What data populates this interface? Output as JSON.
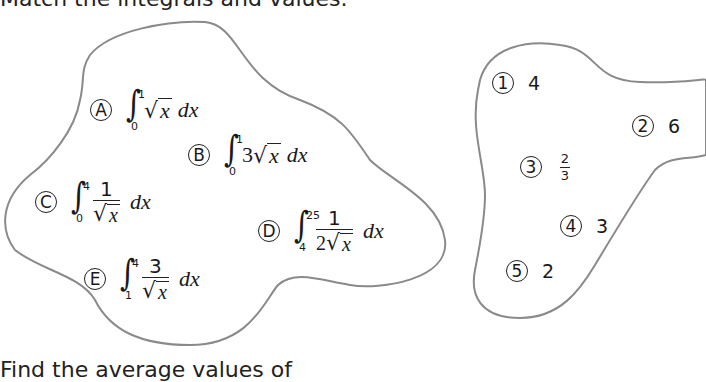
{
  "title": "Match the integrals and values.",
  "footer": "Find the average values of",
  "outline_color": "#8a8a8a",
  "integrals": [
    {
      "label": "A",
      "lower": "0",
      "upper": "1",
      "coef": "",
      "kind": "sqrt",
      "radicand": "x",
      "dx": "dx"
    },
    {
      "label": "B",
      "lower": "0",
      "upper": "1",
      "coef": "3",
      "kind": "sqrt",
      "radicand": "x",
      "dx": "dx"
    },
    {
      "label": "C",
      "lower": "0",
      "upper": "4",
      "numerator": "1",
      "den_coef": "",
      "kind": "frac",
      "radicand": "x",
      "dx": "dx"
    },
    {
      "label": "D",
      "lower": "4",
      "upper": "25",
      "numerator": "1",
      "den_coef": "2",
      "kind": "frac",
      "radicand": "x",
      "dx": "dx"
    },
    {
      "label": "E",
      "lower": "1",
      "upper": "4",
      "numerator": "3",
      "den_coef": "",
      "kind": "frac",
      "radicand": "x",
      "dx": "dx"
    }
  ],
  "values": [
    {
      "label": "1",
      "value": "4"
    },
    {
      "label": "2",
      "value": "6"
    },
    {
      "label": "3",
      "value_num": "2",
      "value_den": "3"
    },
    {
      "label": "4",
      "value": "3"
    },
    {
      "label": "5",
      "value": "2"
    }
  ],
  "sqrt_symbol": "√",
  "integral_symbol": "∫"
}
